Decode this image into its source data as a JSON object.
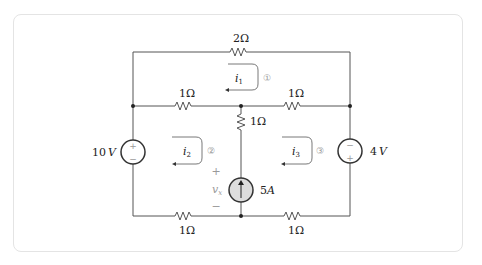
{
  "diagram": {
    "type": "circuit",
    "resistors": {
      "top": "2Ω",
      "mid_left": "1Ω",
      "mid_right": "1Ω",
      "center_vertical": "1Ω",
      "bottom_left": "1Ω",
      "bottom_right": "1Ω"
    },
    "sources": {
      "left_voltage": {
        "label": "10V",
        "value": "10",
        "unit": "V",
        "plus": "+",
        "minus": "−"
      },
      "right_voltage": {
        "label": "4V",
        "value": "4",
        "unit": "V",
        "plus": "+",
        "minus": "−"
      },
      "center_current": {
        "label": "5A",
        "value": "5",
        "unit": "A"
      }
    },
    "mesh_currents": [
      {
        "name": "i",
        "sub": "1",
        "marker": "①"
      },
      {
        "name": "i",
        "sub": "2",
        "marker": "②"
      },
      {
        "name": "i",
        "sub": "3",
        "marker": "③"
      }
    ],
    "vx": {
      "name": "v",
      "sub": "x",
      "plus": "+",
      "minus": "−"
    },
    "colors": {
      "wire": "#555555",
      "source_fill": "#dddddd",
      "annotation": "#999999"
    }
  }
}
